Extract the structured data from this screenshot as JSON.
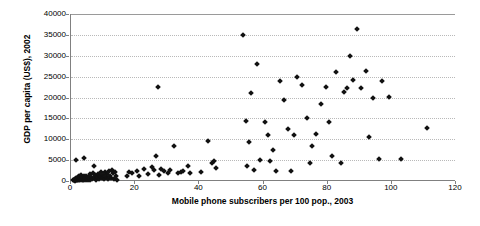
{
  "chart_data": {
    "type": "scatter",
    "title": "",
    "xlabel": "Mobile phone subscribers per 100 pop., 2003",
    "ylabel": "GDP per capita (US$), 2002",
    "xlim": [
      0,
      120
    ],
    "ylim": [
      0,
      40000
    ],
    "xticks": [
      0,
      20,
      40,
      60,
      80,
      100,
      120
    ],
    "yticks": [
      0,
      5000,
      10000,
      15000,
      20000,
      25000,
      30000,
      35000,
      40000
    ],
    "grid": "horizontal-dotted",
    "legend": "none",
    "marker": "diamond",
    "marker_color": "#111111",
    "points": [
      [
        0.6,
        120
      ],
      [
        0.8,
        300
      ],
      [
        1.0,
        180
      ],
      [
        1.1,
        90
      ],
      [
        1.3,
        420
      ],
      [
        1.4,
        250
      ],
      [
        1.5,
        5100
      ],
      [
        1.6,
        700
      ],
      [
        1.7,
        160
      ],
      [
        1.8,
        330
      ],
      [
        1.9,
        560
      ],
      [
        2.0,
        220
      ],
      [
        2.1,
        900
      ],
      [
        2.2,
        140
      ],
      [
        2.4,
        380
      ],
      [
        2.5,
        1250
      ],
      [
        2.6,
        200
      ],
      [
        2.8,
        640
      ],
      [
        2.9,
        170
      ],
      [
        3.0,
        1500
      ],
      [
        3.2,
        420
      ],
      [
        3.4,
        260
      ],
      [
        3.5,
        980
      ],
      [
        3.7,
        350
      ],
      [
        3.9,
        1100
      ],
      [
        4.1,
        5600
      ],
      [
        4.2,
        310
      ],
      [
        4.4,
        760
      ],
      [
        4.6,
        200
      ],
      [
        4.8,
        1300
      ],
      [
        5.0,
        430
      ],
      [
        5.2,
        150
      ],
      [
        5.4,
        880
      ],
      [
        5.6,
        600
      ],
      [
        5.8,
        1600
      ],
      [
        6.0,
        260
      ],
      [
        6.3,
        1050
      ],
      [
        6.6,
        400
      ],
      [
        6.9,
        2000
      ],
      [
        7.1,
        3500
      ],
      [
        7.3,
        620
      ],
      [
        7.6,
        1400
      ],
      [
        7.9,
        330
      ],
      [
        8.2,
        900
      ],
      [
        8.5,
        1750
      ],
      [
        8.8,
        500
      ],
      [
        9.1,
        1200
      ],
      [
        9.4,
        2200
      ],
      [
        9.7,
        700
      ],
      [
        10.0,
        1500
      ],
      [
        10.3,
        380
      ],
      [
        10.6,
        2050
      ],
      [
        10.9,
        1000
      ],
      [
        11.2,
        1650
      ],
      [
        11.5,
        560
      ],
      [
        11.8,
        2400
      ],
      [
        12.1,
        1300
      ],
      [
        12.4,
        820
      ],
      [
        12.7,
        2600
      ],
      [
        13.0,
        1900
      ],
      [
        13.3,
        450
      ],
      [
        13.6,
        2150
      ],
      [
        13.9,
        1100
      ],
      [
        14.2,
        250
      ],
      [
        17.5,
        1250
      ],
      [
        18.2,
        2200
      ],
      [
        19.0,
        1900
      ],
      [
        20.5,
        2500
      ],
      [
        21.3,
        1150
      ],
      [
        22.6,
        2850
      ],
      [
        24.0,
        1650
      ],
      [
        25.2,
        3400
      ],
      [
        25.8,
        2600
      ],
      [
        26.5,
        6050
      ],
      [
        27.0,
        22500
      ],
      [
        27.4,
        1400
      ],
      [
        28.2,
        2900
      ],
      [
        29.0,
        2450
      ],
      [
        30.1,
        1800
      ],
      [
        31.0,
        2600
      ],
      [
        32.0,
        8300
      ],
      [
        33.5,
        1900
      ],
      [
        34.2,
        2100
      ],
      [
        35.0,
        2350
      ],
      [
        36.5,
        3650
      ],
      [
        37.2,
        1950
      ],
      [
        40.5,
        2200
      ],
      [
        42.8,
        9700
      ],
      [
        44.0,
        4300
      ],
      [
        44.5,
        4700
      ],
      [
        45.2,
        3100
      ],
      [
        53.5,
        35000
      ],
      [
        54.5,
        14400
      ],
      [
        55.0,
        3500
      ],
      [
        55.5,
        9400
      ],
      [
        56.2,
        21000
      ],
      [
        57.0,
        2600
      ],
      [
        58.0,
        28000
      ],
      [
        59.0,
        5100
      ],
      [
        60.5,
        14100
      ],
      [
        61.5,
        11000
      ],
      [
        62.0,
        4900
      ],
      [
        63.0,
        7400
      ],
      [
        64.0,
        2400
      ],
      [
        65.0,
        24000
      ],
      [
        66.5,
        19500
      ],
      [
        67.5,
        12400
      ],
      [
        68.5,
        2300
      ],
      [
        69.5,
        11000
      ],
      [
        70.5,
        25000
      ],
      [
        72.0,
        23000
      ],
      [
        73.5,
        15000
      ],
      [
        74.5,
        4400
      ],
      [
        75.0,
        8400
      ],
      [
        76.5,
        11200
      ],
      [
        78.0,
        18400
      ],
      [
        79.5,
        22400
      ],
      [
        80.5,
        14100
      ],
      [
        81.5,
        6000
      ],
      [
        82.5,
        26200
      ],
      [
        84.0,
        4300
      ],
      [
        85.0,
        21400
      ],
      [
        86.0,
        22200
      ],
      [
        87.0,
        30000
      ],
      [
        88.0,
        24300
      ],
      [
        89.0,
        36500
      ],
      [
        90.5,
        22300
      ],
      [
        92.0,
        26400
      ],
      [
        93.0,
        10500
      ],
      [
        94.0,
        20000
      ],
      [
        96.0,
        5200
      ],
      [
        97.0,
        24000
      ],
      [
        99.0,
        20100
      ],
      [
        103.0,
        5200
      ],
      [
        111.0,
        12700
      ]
    ]
  }
}
